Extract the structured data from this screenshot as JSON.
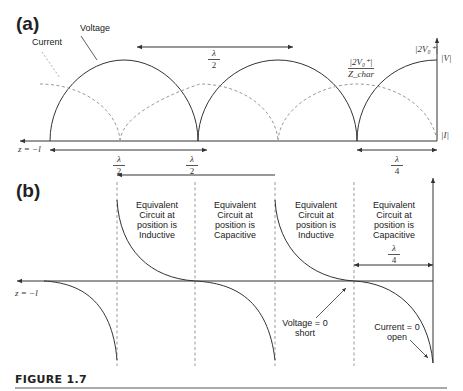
{
  "panels": {
    "a": {
      "label": "(a)",
      "legend": {
        "current": "Current",
        "voltage": "Voltage"
      },
      "axis_start_label": "z = −l",
      "right_axis_top_label": "|V|",
      "right_axis_bottom_label": "|I|",
      "voltage_peak_label": "|2V₀⁺|",
      "current_peak_label_num": "|2V₀⁺|",
      "current_peak_label_den": "Z_char",
      "top_arrow_label": {
        "num": "λ",
        "den": "2"
      },
      "lower_left_arrow_label": {
        "num": "λ",
        "den": "2"
      },
      "lower_mid_arrow_label": {
        "num": "λ",
        "den": "2"
      },
      "lower_right_arrow_label": {
        "num": "λ",
        "den": "4"
      }
    },
    "b": {
      "label": "(b)",
      "axis_start_label": "z = −l",
      "regions": [
        {
          "text": [
            "Equivalent",
            "Circuit at",
            "position is",
            "Inductive"
          ]
        },
        {
          "text": [
            "Equivalent",
            "Circuit at",
            "position is",
            "Capacitive"
          ]
        },
        {
          "text": [
            "Equivalent",
            "Circuit at",
            "position is",
            "Inductive"
          ]
        },
        {
          "text": [
            "Equivalent",
            "Circuit at",
            "position is",
            "Capacitive"
          ]
        }
      ],
      "quarter_arrow_label": {
        "num": "λ",
        "den": "4"
      },
      "annotations": {
        "voltage_zero": [
          "Voltage = 0",
          "short"
        ],
        "current_zero": [
          "Current = 0",
          "open"
        ]
      }
    }
  },
  "caption": "FIGURE 1.7",
  "colors": {
    "line": "#333333",
    "dashed": "#999999",
    "text": "#222222"
  }
}
